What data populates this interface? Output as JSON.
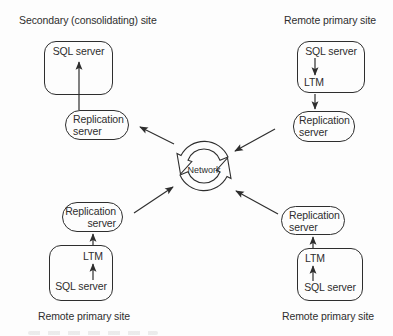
{
  "sites": {
    "top_left": {
      "label": "Secondary (consolidating) site",
      "sql_server": "SQL server",
      "replication_line1": "Replication",
      "replication_line2": "server"
    },
    "top_right": {
      "label": "Remote primary site",
      "sql_server": "SQL server",
      "ltm": "LTM",
      "replication_line1": "Replication",
      "replication_line2": "server"
    },
    "bottom_left": {
      "label": "Remote primary site",
      "sql_server": "SQL server",
      "ltm": "LTM",
      "replication_line1": "Replication",
      "replication_line2": "server"
    },
    "bottom_right": {
      "label": "Remote primary site",
      "sql_server": "SQL server",
      "ltm": "LTM",
      "replication_line1": "Replication",
      "replication_line2": "server"
    }
  },
  "network": {
    "label": "Network"
  },
  "colors": {
    "line": "#2e2e2e",
    "text": "#2e2e2e",
    "background": "#fdfdfd"
  }
}
